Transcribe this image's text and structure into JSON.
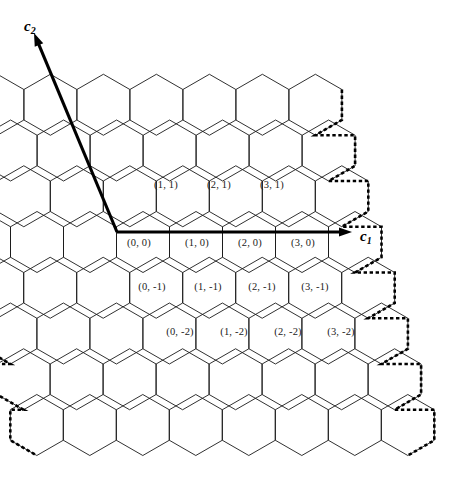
{
  "figure": {
    "name": "hexagonal-lattice-coordinate-diagram",
    "background_color": "#ffffff",
    "line_color": "#1a1a1a",
    "dashed_color": "#000000",
    "axis_color": "#000000"
  },
  "axes": [
    {
      "id": "c1",
      "label": "c",
      "subscript": "1",
      "x": 360,
      "y": 228,
      "direction": "right",
      "from": [
        117,
        232
      ],
      "to": [
        352,
        232
      ]
    },
    {
      "id": "c2",
      "label": "c",
      "subscript": "2",
      "x": 24,
      "y": 18,
      "direction": "up-left",
      "from": [
        117,
        232
      ],
      "to": [
        34,
        33
      ]
    }
  ],
  "lattice": {
    "orientation": "pointy-top",
    "hex_width": 53,
    "hex_height": 61,
    "row_spacing": 45.75,
    "origin_center": [
      143,
      242
    ],
    "col_range": [
      -3,
      4
    ],
    "row_range": [
      -4,
      3
    ],
    "boundary_style": "dashed",
    "interior_style": "solid-thin"
  },
  "cells": [
    {
      "label": "(1, 1)",
      "c1": 1,
      "c2": 1,
      "x": 166,
      "y": 184
    },
    {
      "label": "(2, 1)",
      "c1": 2,
      "c2": 1,
      "x": 219,
      "y": 184
    },
    {
      "label": "(3, 1)",
      "c1": 3,
      "c2": 1,
      "x": 272,
      "y": 184
    },
    {
      "label": "(0, 0)",
      "c1": 0,
      "c2": 0,
      "x": 139,
      "y": 242
    },
    {
      "label": "(1, 0)",
      "c1": 1,
      "c2": 0,
      "x": 197,
      "y": 242
    },
    {
      "label": "(2, 0)",
      "c1": 2,
      "c2": 0,
      "x": 250,
      "y": 242
    },
    {
      "label": "(3, 0)",
      "c1": 3,
      "c2": 0,
      "x": 303,
      "y": 242
    },
    {
      "label": "(0, -1)",
      "c1": 0,
      "c2": -1,
      "x": 152,
      "y": 286
    },
    {
      "label": "(1, -1)",
      "c1": 1,
      "c2": -1,
      "x": 208,
      "y": 286
    },
    {
      "label": "(2, -1)",
      "c1": 2,
      "c2": -1,
      "x": 262,
      "y": 286
    },
    {
      "label": "(3, -1)",
      "c1": 3,
      "c2": -1,
      "x": 315,
      "y": 286
    },
    {
      "label": "(0, -2)",
      "c1": 0,
      "c2": -2,
      "x": 180,
      "y": 331
    },
    {
      "label": "(1, -2)",
      "c1": 1,
      "c2": -2,
      "x": 234,
      "y": 331
    },
    {
      "label": "(2, -2)",
      "c1": 2,
      "c2": -2,
      "x": 288,
      "y": 331
    },
    {
      "label": "(3, -2)",
      "c1": 3,
      "c2": -2,
      "x": 341,
      "y": 331
    }
  ]
}
